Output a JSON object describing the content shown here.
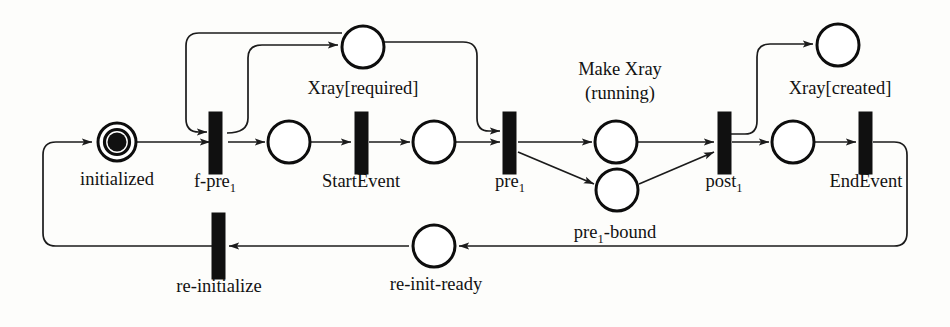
{
  "diagram": {
    "background_color": "#fdfdfb",
    "stroke_color": "#1b1b1b",
    "places": [
      {
        "id": "initialized",
        "label": "initialized",
        "label_main": "initialized",
        "cx": 117,
        "cy": 142,
        "r": 19,
        "tokens": 1,
        "double_ring": true
      },
      {
        "id": "xray-required",
        "label": "Xray[required]",
        "label_main": "Xray[required]",
        "cx": 363,
        "cy": 47,
        "r": 21,
        "tokens": 0,
        "double_ring": false
      },
      {
        "id": "place-start",
        "label": "",
        "label_main": "",
        "cx": 289,
        "cy": 142,
        "r": 21,
        "tokens": 0,
        "double_ring": false
      },
      {
        "id": "place-pre",
        "label": "",
        "label_main": "",
        "cx": 434,
        "cy": 142,
        "r": 21,
        "tokens": 0,
        "double_ring": false
      },
      {
        "id": "make-xray-running",
        "label": "Make Xray (running)",
        "label_line1": "Make Xray",
        "label_line2": "(running)",
        "cx": 616,
        "cy": 142,
        "r": 21,
        "tokens": 0,
        "double_ring": false
      },
      {
        "id": "pre1-bound",
        "label": "pre1-bound",
        "label_main": "pre",
        "label_sub": "1",
        "label_tail": "-bound",
        "cx": 617,
        "cy": 190,
        "r": 21,
        "tokens": 0,
        "double_ring": false
      },
      {
        "id": "xray-created",
        "label": "Xray[created]",
        "label_main": "Xray[created]",
        "cx": 838,
        "cy": 45,
        "r": 21,
        "tokens": 0,
        "double_ring": false
      },
      {
        "id": "place-end",
        "label": "",
        "label_main": "",
        "cx": 793,
        "cy": 142,
        "r": 21,
        "tokens": 0,
        "double_ring": false
      },
      {
        "id": "re-init-ready",
        "label": "re-init-ready",
        "label_main": "re-init-ready",
        "cx": 434,
        "cy": 246,
        "r": 21,
        "tokens": 0,
        "double_ring": false
      }
    ],
    "transitions": [
      {
        "id": "f-pre1",
        "label": "f-pre1",
        "label_main": "f-pre",
        "label_sub": "1",
        "x": 214,
        "y": 112,
        "w": 13,
        "h": 62
      },
      {
        "id": "start-event",
        "label": "StartEvent",
        "label_main": "StartEvent",
        "x": 355,
        "y": 112,
        "w": 13,
        "h": 62
      },
      {
        "id": "pre1",
        "label": "pre1",
        "label_main": "pre",
        "label_sub": "1",
        "x": 504,
        "y": 112,
        "w": 13,
        "h": 62
      },
      {
        "id": "post1",
        "label": "post1",
        "label_main": "post",
        "label_sub": "1",
        "x": 718,
        "y": 112,
        "w": 13,
        "h": 62
      },
      {
        "id": "end-event",
        "label": "EndEvent",
        "label_main": "EndEvent",
        "x": 860,
        "y": 112,
        "w": 13,
        "h": 62
      },
      {
        "id": "re-initialize",
        "label": "re-initialize",
        "label_main": "re-initialize",
        "x": 212,
        "y": 213,
        "w": 13,
        "h": 66
      }
    ],
    "labels": [
      {
        "id": "label-initialized",
        "text": "initialized",
        "x": 117,
        "y": 185
      },
      {
        "id": "label-f-pre1",
        "text": "f-pre",
        "sub": "1",
        "x": 215,
        "y": 187
      },
      {
        "id": "label-startevent",
        "text": "StartEvent",
        "x": 361,
        "y": 187
      },
      {
        "id": "label-pre1",
        "text": "pre",
        "sub": "1",
        "x": 510,
        "y": 187
      },
      {
        "id": "label-post1",
        "text": "post",
        "sub": "1",
        "x": 724,
        "y": 187
      },
      {
        "id": "label-endevent",
        "text": "EndEvent",
        "x": 866,
        "y": 187
      },
      {
        "id": "label-xray-required",
        "text": "Xray[required]",
        "x": 363,
        "y": 94
      },
      {
        "id": "label-make-xray-1",
        "text": "Make Xray",
        "x": 620,
        "y": 75
      },
      {
        "id": "label-make-xray-2",
        "text": "(running)",
        "x": 620,
        "y": 99
      },
      {
        "id": "label-xray-created",
        "text": "Xray[created]",
        "x": 840,
        "y": 94
      },
      {
        "id": "label-pre1-bound",
        "text": "pre",
        "sub": "1",
        "tail": "-bound",
        "x": 615,
        "y": 238
      },
      {
        "id": "label-re-init-ready",
        "text": "re-init-ready",
        "x": 436,
        "y": 290
      },
      {
        "id": "label-re-initialize",
        "text": "re-initialize",
        "x": 219,
        "y": 292
      }
    ],
    "arcs": [
      {
        "id": "arc-reinit-to-initialized",
        "from": "re-initialize",
        "to": "initialized"
      },
      {
        "id": "arc-initialized-to-fpre1",
        "from": "initialized",
        "to": "f-pre1"
      },
      {
        "id": "arc-fpre1-to-xray-required",
        "from": "f-pre1",
        "to": "xray-required"
      },
      {
        "id": "arc-xray-required-to-fpre1",
        "from": "xray-required",
        "to": "f-pre1"
      },
      {
        "id": "arc-fpre1-to-place-start",
        "from": "f-pre1",
        "to": "place-start"
      },
      {
        "id": "arc-place-start-to-startevent",
        "from": "place-start",
        "to": "start-event"
      },
      {
        "id": "arc-startevent-to-place-pre",
        "from": "start-event",
        "to": "place-pre"
      },
      {
        "id": "arc-place-pre-to-pre1",
        "from": "place-pre",
        "to": "pre1"
      },
      {
        "id": "arc-xray-required-to-pre1",
        "from": "xray-required",
        "to": "pre1"
      },
      {
        "id": "arc-pre1-to-running",
        "from": "pre1",
        "to": "make-xray-running"
      },
      {
        "id": "arc-pre1-to-pre1-bound",
        "from": "pre1",
        "to": "pre1-bound"
      },
      {
        "id": "arc-running-to-post1",
        "from": "make-xray-running",
        "to": "post1"
      },
      {
        "id": "arc-pre1-bound-to-post1",
        "from": "pre1-bound",
        "to": "post1"
      },
      {
        "id": "arc-post1-to-xray-created",
        "from": "post1",
        "to": "xray-created"
      },
      {
        "id": "arc-post1-to-place-end",
        "from": "post1",
        "to": "place-end"
      },
      {
        "id": "arc-place-end-to-endevent",
        "from": "place-end",
        "to": "end-event"
      },
      {
        "id": "arc-endevent-to-re-init-ready",
        "from": "end-event",
        "to": "re-init-ready"
      },
      {
        "id": "arc-re-init-ready-to-re-initialize",
        "from": "re-init-ready",
        "to": "re-initialize"
      }
    ]
  }
}
